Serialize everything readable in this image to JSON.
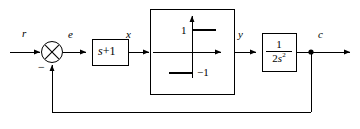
{
  "diagram": {
    "type": "control-system-block-diagram",
    "background_color": "#ffffff",
    "line_color": "#000000",
    "signals": {
      "reference": "r",
      "error": "e",
      "controller_output": "x",
      "nonlinearity_output": "y",
      "plant_output": "c"
    },
    "summing_junction": {
      "name": "summing-junction",
      "symbol": "cross",
      "feedback_sign": "−"
    },
    "controller_block": {
      "name": "controller-block",
      "label": "s+1",
      "variable": "s",
      "rest": "+1"
    },
    "nonlinearity_block": {
      "name": "nonlinearity-block",
      "kind": "ideal-relay",
      "upper_level": "1",
      "lower_level": "−1",
      "description": "ideal relay / signum characteristic"
    },
    "plant_block": {
      "name": "plant-block",
      "numerator": "1",
      "denominator_coeff": "2",
      "denominator_var": "s",
      "denominator_exp": "2",
      "label": "1/(2s²)"
    },
    "feedback": {
      "name": "feedback-path",
      "takeoff_point": "c",
      "sign": "−"
    }
  }
}
